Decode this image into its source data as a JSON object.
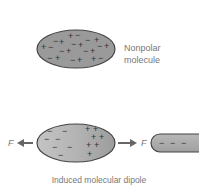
{
  "top_panel": {
    "label_line1": "Nonpolar",
    "label_line2": "molecule",
    "charges": [
      "+",
      "−",
      "−",
      "+",
      "−",
      "+",
      "+",
      "−",
      "+",
      "−",
      "+",
      "−",
      "+",
      "−",
      "+",
      "−",
      "+",
      "+",
      "−",
      "−",
      "+",
      "+",
      "−",
      "−",
      "+"
    ]
  },
  "bottom_panel": {
    "force_left": "F",
    "force_right": "F",
    "caption": "Induced molecular dipole",
    "negative_sign": "−",
    "positive_sign": "+",
    "rod_charges": "− − −"
  },
  "colors": {
    "molecule_fill": "#9a9a9a",
    "molecule_gradient_light": "#c8c8c8",
    "outline": "#444444",
    "arrow": "#666666",
    "label": "#777777"
  }
}
